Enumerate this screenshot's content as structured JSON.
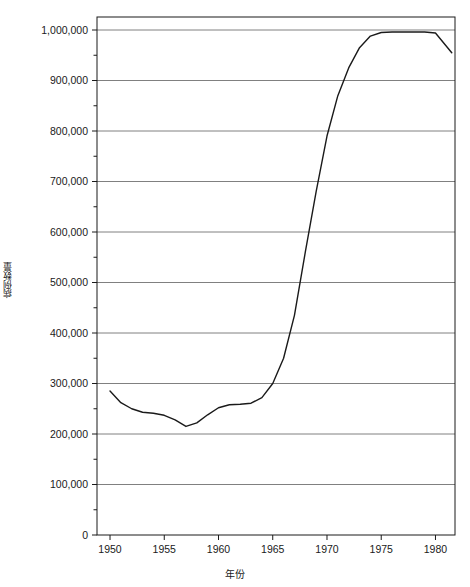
{
  "chart_data": {
    "type": "line",
    "title": "",
    "xlabel": "年份",
    "ylabel": "病例数量",
    "xlim": [
      1948.8,
      1981.8
    ],
    "ylim": [
      0,
      1000000
    ],
    "grid": true,
    "legend": null,
    "x_ticks": [
      1950,
      1955,
      1960,
      1965,
      1970,
      1975,
      1980
    ],
    "x_tick_labels": [
      "1950",
      "1955",
      "1960",
      "1965",
      "1970",
      "1975",
      "1980"
    ],
    "x_minor_tick_interval": 1,
    "y_ticks": [
      0,
      100000,
      200000,
      300000,
      400000,
      500000,
      600000,
      700000,
      800000,
      900000,
      1000000
    ],
    "y_tick_labels": [
      "0",
      "100,000",
      "200,000",
      "300,000",
      "400,000",
      "500,000",
      "600,000",
      "700,000",
      "800,000",
      "900,000",
      "1,000,000"
    ],
    "y_minor_tick_interval": 50000,
    "line_color": "#1a1a1a",
    "grid_color": "#808080",
    "series": [
      {
        "name": "病例数量",
        "x": [
          1950,
          1951,
          1952,
          1953,
          1954,
          1955,
          1956,
          1957,
          1958,
          1959,
          1960,
          1961,
          1962,
          1963,
          1964,
          1965,
          1966,
          1967,
          1968,
          1969,
          1970,
          1971,
          1972,
          1973,
          1974,
          1975,
          1976,
          1977,
          1978,
          1979,
          1980,
          1981.5
        ],
        "values": [
          285000,
          262000,
          250000,
          243000,
          241000,
          237000,
          228000,
          215000,
          222000,
          238000,
          252000,
          258000,
          259000,
          261000,
          272000,
          300000,
          350000,
          435000,
          560000,
          680000,
          790000,
          870000,
          925000,
          965000,
          988000,
          995000,
          996000,
          996000,
          996000,
          996000,
          994000,
          955000
        ]
      }
    ]
  },
  "axes": {
    "y_axis_label": "病例数量",
    "x_axis_label": "年份"
  }
}
